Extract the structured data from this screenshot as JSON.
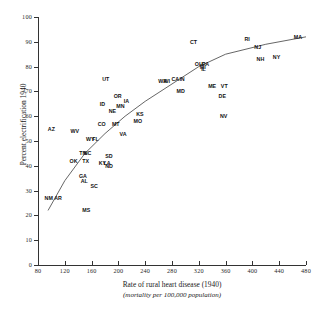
{
  "chart_data": {
    "type": "scatter",
    "title": "",
    "xlabel": "Rate of rural heart disease (1940)",
    "xlabel_sub": "(mortality per 100,000 population)",
    "ylabel": "Percent electrification 1940",
    "xlim": [
      80,
      480
    ],
    "ylim": [
      0,
      100
    ],
    "xticks": [
      80,
      120,
      160,
      200,
      240,
      280,
      320,
      360,
      400,
      440,
      480
    ],
    "yticks": [
      0,
      10,
      20,
      30,
      40,
      50,
      60,
      70,
      80,
      90,
      100
    ],
    "grid": false,
    "legend": null,
    "point_label_field": "state",
    "fit_line": {
      "present": true,
      "style": "smooth-curve",
      "color": "#555555",
      "description": "monotone increasing concave curve rising from about (95, 22) to (480, 92)"
    },
    "points": [
      {
        "state": "NM",
        "x": 96,
        "y": 27
      },
      {
        "state": "AR",
        "x": 110,
        "y": 27
      },
      {
        "state": "MS",
        "x": 152,
        "y": 22
      },
      {
        "state": "AZ",
        "x": 100,
        "y": 55
      },
      {
        "state": "OK",
        "x": 133,
        "y": 42
      },
      {
        "state": "TN",
        "x": 147,
        "y": 45
      },
      {
        "state": "NC",
        "x": 154,
        "y": 45
      },
      {
        "state": "TX",
        "x": 151,
        "y": 42
      },
      {
        "state": "GA",
        "x": 147,
        "y": 36
      },
      {
        "state": "AL",
        "x": 149,
        "y": 34
      },
      {
        "state": "SC",
        "x": 164,
        "y": 32
      },
      {
        "state": "KY",
        "x": 176,
        "y": 41
      },
      {
        "state": "LA",
        "x": 183,
        "y": 41
      },
      {
        "state": "SD",
        "x": 186,
        "y": 44
      },
      {
        "state": "ND",
        "x": 186,
        "y": 40
      },
      {
        "state": "WV",
        "x": 135,
        "y": 54
      },
      {
        "state": "WY",
        "x": 158,
        "y": 51
      },
      {
        "state": "FL",
        "x": 166,
        "y": 51
      },
      {
        "state": "CO",
        "x": 175,
        "y": 57
      },
      {
        "state": "MT",
        "x": 196,
        "y": 57
      },
      {
        "state": "ID",
        "x": 176,
        "y": 65
      },
      {
        "state": "NE",
        "x": 191,
        "y": 62
      },
      {
        "state": "MN",
        "x": 203,
        "y": 64
      },
      {
        "state": "OR",
        "x": 199,
        "y": 68
      },
      {
        "state": "IA",
        "x": 212,
        "y": 66
      },
      {
        "state": "VA",
        "x": 207,
        "y": 53
      },
      {
        "state": "MO",
        "x": 229,
        "y": 58
      },
      {
        "state": "KS",
        "x": 232,
        "y": 61
      },
      {
        "state": "UT",
        "x": 181,
        "y": 75
      },
      {
        "state": "WA",
        "x": 266,
        "y": 74
      },
      {
        "state": "WI",
        "x": 272,
        "y": 74
      },
      {
        "state": "CA",
        "x": 285,
        "y": 75
      },
      {
        "state": "IN",
        "x": 295,
        "y": 75
      },
      {
        "state": "MD",
        "x": 293,
        "y": 70
      },
      {
        "state": "OH",
        "x": 320,
        "y": 81
      },
      {
        "state": "PA",
        "x": 330,
        "y": 81
      },
      {
        "state": "MI",
        "x": 326,
        "y": 80
      },
      {
        "state": "IL",
        "x": 327,
        "y": 79
      },
      {
        "state": "CT",
        "x": 312,
        "y": 90
      },
      {
        "state": "ME",
        "x": 340,
        "y": 72
      },
      {
        "state": "VT",
        "x": 358,
        "y": 72
      },
      {
        "state": "DE",
        "x": 355,
        "y": 68
      },
      {
        "state": "NV",
        "x": 357,
        "y": 60
      },
      {
        "state": "RI",
        "x": 392,
        "y": 91
      },
      {
        "state": "NJ",
        "x": 408,
        "y": 88
      },
      {
        "state": "NH",
        "x": 412,
        "y": 83
      },
      {
        "state": "NY",
        "x": 436,
        "y": 84
      },
      {
        "state": "MA",
        "x": 468,
        "y": 92
      }
    ]
  }
}
